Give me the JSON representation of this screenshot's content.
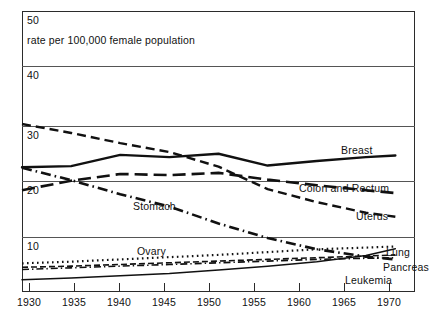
{
  "chart_data": {
    "type": "line",
    "title": "",
    "subtitle": "rate per 100,000 female population",
    "xlabel": "",
    "ylabel": "",
    "xlim": [
      1930,
      1970
    ],
    "ylim": [
      0,
      50
    ],
    "grid": true,
    "legend_position": "inline-right-of-series",
    "x_ticks": [
      1930,
      1935,
      1940,
      1945,
      1950,
      1955,
      1960,
      1965,
      1970
    ],
    "x_tick_labels": [
      "1930",
      "1935",
      "1940",
      "1945",
      "1950",
      "1955",
      "1960",
      "1965",
      "1970"
    ],
    "y_ticks": [
      10,
      20,
      30,
      40,
      50
    ],
    "y_tick_labels": [
      "10",
      "20",
      "30",
      "40",
      "50"
    ],
    "series": [
      {
        "name": "Breast",
        "label": "Breast",
        "style": "solid",
        "x": [
          1930,
          1935,
          1940,
          1945,
          1950,
          1955,
          1960,
          1965,
          1968
        ],
        "values": [
          22.2,
          22.4,
          24.4,
          24.0,
          24.6,
          22.5,
          23.3,
          24.0,
          24.3
        ]
      },
      {
        "name": "Uterus",
        "label": "Uterus",
        "style": "dashed",
        "x": [
          1930,
          1935,
          1940,
          1945,
          1950,
          1955,
          1960,
          1965,
          1968
        ],
        "values": [
          29.9,
          28.3,
          26.5,
          24.9,
          22.3,
          18.3,
          16.0,
          14.1,
          13.4
        ]
      },
      {
        "name": "Colon and Rectum",
        "label": "Colon and Rectum",
        "style": "long-dash",
        "x": [
          1930,
          1935,
          1940,
          1945,
          1950,
          1955,
          1960,
          1965,
          1968
        ],
        "values": [
          18.1,
          19.8,
          21.0,
          20.8,
          21.2,
          20.0,
          19.0,
          18.1,
          17.6
        ]
      },
      {
        "name": "Stomach",
        "label": "Stomach",
        "style": "dash-dot",
        "x": [
          1930,
          1935,
          1940,
          1945,
          1950,
          1955,
          1960,
          1965,
          1968
        ],
        "values": [
          22.1,
          19.9,
          17.4,
          15.2,
          12.2,
          9.6,
          7.6,
          6.3,
          5.8
        ]
      },
      {
        "name": "Ovary",
        "label": "Ovary",
        "style": "dotted",
        "x": [
          1930,
          1935,
          1940,
          1945,
          1950,
          1955,
          1960,
          1965,
          1968
        ],
        "values": [
          5.1,
          5.4,
          5.8,
          6.2,
          6.6,
          7.1,
          7.6,
          7.9,
          8.1
        ]
      },
      {
        "name": "Lung",
        "label": "Lung",
        "style": "thin-solid",
        "x": [
          1930,
          1935,
          1940,
          1945,
          1950,
          1955,
          1960,
          1965,
          1968
        ],
        "values": [
          2.2,
          2.5,
          2.9,
          3.3,
          3.9,
          4.6,
          5.4,
          6.5,
          7.7
        ]
      },
      {
        "name": "Pancreas",
        "label": "Pancreas",
        "style": "thin-dashed",
        "x": [
          1930,
          1935,
          1940,
          1945,
          1950,
          1955,
          1960,
          1965,
          1968
        ],
        "values": [
          4.4,
          4.6,
          4.9,
          5.2,
          5.5,
          5.8,
          6.1,
          6.4,
          6.6
        ]
      },
      {
        "name": "Leukemia",
        "label": "Leukemia",
        "style": "thin-dash-dot",
        "x": [
          1930,
          1935,
          1940,
          1945,
          1950,
          1955,
          1960,
          1965,
          1968
        ],
        "values": [
          4.0,
          4.3,
          4.6,
          4.9,
          5.2,
          5.5,
          5.8,
          6.0,
          6.1
        ]
      }
    ],
    "colors": {
      "line": "#111111",
      "grid": "#555555",
      "frame": "#2b2b2b",
      "background": "#ffffff"
    }
  }
}
